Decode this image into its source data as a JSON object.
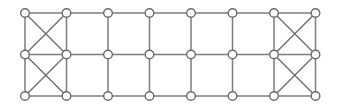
{
  "figure": {
    "width": 338,
    "height": 108,
    "background_color": "#ffffff"
  },
  "style": {
    "edge_color": "#7d7d7d",
    "diagonal_edge_color": "#6e6e6e",
    "node_fill_color": "#ffffff",
    "node_stroke_color": "#6b6b6b",
    "edge_width": 1.5,
    "diagonal_edge_width": 1.4,
    "node_radius": 4.3,
    "node_stroke_width": 1.4
  },
  "graph_data": {
    "type": "graph",
    "description": "8 by 3 rectangular grid lattice; the leftmost and rightmost cell columns each contain both diagonals forming X crossings in both row bands",
    "columns": 8,
    "rows": 3,
    "node_count": 24,
    "column_x": [
      25,
      66.5,
      108,
      149.5,
      191,
      232.5,
      274,
      315.5
    ],
    "row_y": [
      13,
      54.5,
      96
    ],
    "nodes": [
      {
        "id": "r0c0",
        "row": 0,
        "col": 0,
        "x": 25,
        "y": 13
      },
      {
        "id": "r0c1",
        "row": 0,
        "col": 1,
        "x": 66.5,
        "y": 13
      },
      {
        "id": "r0c2",
        "row": 0,
        "col": 2,
        "x": 108,
        "y": 13
      },
      {
        "id": "r0c3",
        "row": 0,
        "col": 3,
        "x": 149.5,
        "y": 13
      },
      {
        "id": "r0c4",
        "row": 0,
        "col": 4,
        "x": 191,
        "y": 13
      },
      {
        "id": "r0c5",
        "row": 0,
        "col": 5,
        "x": 232.5,
        "y": 13
      },
      {
        "id": "r0c6",
        "row": 0,
        "col": 6,
        "x": 274,
        "y": 13
      },
      {
        "id": "r0c7",
        "row": 0,
        "col": 7,
        "x": 315.5,
        "y": 13
      },
      {
        "id": "r1c0",
        "row": 1,
        "col": 0,
        "x": 25,
        "y": 54.5
      },
      {
        "id": "r1c1",
        "row": 1,
        "col": 1,
        "x": 66.5,
        "y": 54.5
      },
      {
        "id": "r1c2",
        "row": 1,
        "col": 2,
        "x": 108,
        "y": 54.5
      },
      {
        "id": "r1c3",
        "row": 1,
        "col": 3,
        "x": 149.5,
        "y": 54.5
      },
      {
        "id": "r1c4",
        "row": 1,
        "col": 4,
        "x": 191,
        "y": 54.5
      },
      {
        "id": "r1c5",
        "row": 1,
        "col": 5,
        "x": 232.5,
        "y": 54.5
      },
      {
        "id": "r1c6",
        "row": 1,
        "col": 6,
        "x": 274,
        "y": 54.5
      },
      {
        "id": "r1c7",
        "row": 1,
        "col": 7,
        "x": 315.5,
        "y": 54.5
      },
      {
        "id": "r2c0",
        "row": 2,
        "col": 0,
        "x": 25,
        "y": 96
      },
      {
        "id": "r2c1",
        "row": 2,
        "col": 1,
        "x": 66.5,
        "y": 96
      },
      {
        "id": "r2c2",
        "row": 2,
        "col": 2,
        "x": 108,
        "y": 96
      },
      {
        "id": "r2c3",
        "row": 2,
        "col": 3,
        "x": 149.5,
        "y": 96
      },
      {
        "id": "r2c4",
        "row": 2,
        "col": 4,
        "x": 191,
        "y": 96
      },
      {
        "id": "r2c5",
        "row": 2,
        "col": 5,
        "x": 232.5,
        "y": 96
      },
      {
        "id": "r2c6",
        "row": 2,
        "col": 6,
        "x": 274,
        "y": 96
      },
      {
        "id": "r2c7",
        "row": 2,
        "col": 7,
        "x": 315.5,
        "y": 96
      }
    ],
    "horizontal_edges": [
      [
        "r0c0",
        "r0c1"
      ],
      [
        "r0c1",
        "r0c2"
      ],
      [
        "r0c2",
        "r0c3"
      ],
      [
        "r0c3",
        "r0c4"
      ],
      [
        "r0c4",
        "r0c5"
      ],
      [
        "r0c5",
        "r0c6"
      ],
      [
        "r0c6",
        "r0c7"
      ],
      [
        "r1c0",
        "r1c1"
      ],
      [
        "r1c1",
        "r1c2"
      ],
      [
        "r1c2",
        "r1c3"
      ],
      [
        "r1c3",
        "r1c4"
      ],
      [
        "r1c4",
        "r1c5"
      ],
      [
        "r1c5",
        "r1c6"
      ],
      [
        "r1c6",
        "r1c7"
      ],
      [
        "r2c0",
        "r2c1"
      ],
      [
        "r2c1",
        "r2c2"
      ],
      [
        "r2c2",
        "r2c3"
      ],
      [
        "r2c3",
        "r2c4"
      ],
      [
        "r2c4",
        "r2c5"
      ],
      [
        "r2c5",
        "r2c6"
      ],
      [
        "r2c6",
        "r2c7"
      ]
    ],
    "vertical_edges": [
      [
        "r0c0",
        "r1c0"
      ],
      [
        "r1c0",
        "r2c0"
      ],
      [
        "r0c1",
        "r1c1"
      ],
      [
        "r1c1",
        "r2c1"
      ],
      [
        "r0c2",
        "r1c2"
      ],
      [
        "r1c2",
        "r2c2"
      ],
      [
        "r0c3",
        "r1c3"
      ],
      [
        "r1c3",
        "r2c3"
      ],
      [
        "r0c4",
        "r1c4"
      ],
      [
        "r1c4",
        "r2c4"
      ],
      [
        "r0c5",
        "r1c5"
      ],
      [
        "r1c5",
        "r2c5"
      ],
      [
        "r0c6",
        "r1c6"
      ],
      [
        "r1c6",
        "r2c6"
      ],
      [
        "r0c7",
        "r1c7"
      ],
      [
        "r1c7",
        "r2c7"
      ]
    ],
    "diagonal_edges": [
      [
        "r0c0",
        "r1c1"
      ],
      [
        "r0c1",
        "r1c0"
      ],
      [
        "r1c0",
        "r2c1"
      ],
      [
        "r1c1",
        "r2c0"
      ],
      [
        "r0c6",
        "r1c7"
      ],
      [
        "r0c7",
        "r1c6"
      ],
      [
        "r1c6",
        "r2c7"
      ],
      [
        "r1c7",
        "r2c6"
      ]
    ],
    "crossed_cells": [
      {
        "label": "top-left",
        "cols": [
          0,
          1
        ],
        "rows": [
          0,
          1
        ]
      },
      {
        "label": "bottom-left",
        "cols": [
          0,
          1
        ],
        "rows": [
          1,
          2
        ]
      },
      {
        "label": "top-right",
        "cols": [
          6,
          7
        ],
        "rows": [
          0,
          1
        ]
      },
      {
        "label": "bottom-right",
        "cols": [
          6,
          7
        ],
        "rows": [
          1,
          2
        ]
      }
    ]
  }
}
